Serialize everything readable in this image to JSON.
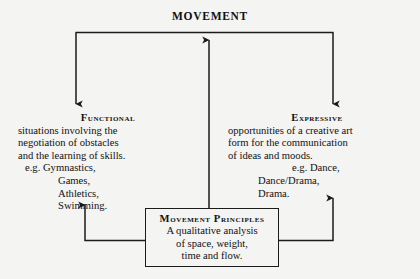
{
  "diagram": {
    "title": "MOVEMENT",
    "type": "flow-diagram",
    "line_color": "#1b1b1b",
    "background_color": "#f4f4f3",
    "branches": [
      {
        "id": "functional",
        "heading": "Functional",
        "lines": [
          "situations involving the",
          "negotiation of obstacles",
          "and the learning of skills."
        ],
        "examples_lead": "e.g. Gymnastics,",
        "examples": [
          "Games,",
          "Athletics,",
          "Swimming."
        ]
      },
      {
        "id": "expressive",
        "heading": "Expressive",
        "lines": [
          "opportunities of a creative art",
          "form for the communication",
          "of ideas and moods."
        ],
        "examples_lead": "e.g. Dance,",
        "examples": [
          "Dance/Drama,",
          "Drama."
        ]
      }
    ],
    "center_box": {
      "heading": "Movement Principles",
      "lines": [
        "A qualitative analysis",
        "of space, weight,",
        "time and flow."
      ]
    }
  }
}
